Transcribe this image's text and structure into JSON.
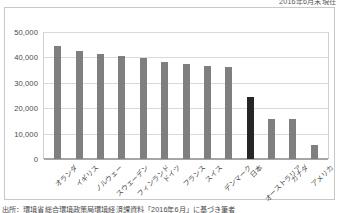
{
  "header": {
    "note": "2016年6月末現在"
  },
  "footer": {
    "source": "出所：環境省総合環境政策局環境経済課資料「2016年6月」に基づき筆者"
  },
  "chart_data": {
    "type": "bar",
    "title": "",
    "xlabel": "",
    "ylabel": "",
    "ylim": [
      0,
      50000
    ],
    "yticks": [
      "0",
      "10,000",
      "20,000",
      "30,000",
      "40,000",
      "50,000"
    ],
    "ytick_values": [
      0,
      10000,
      20000,
      30000,
      40000,
      50000
    ],
    "grid": true,
    "legend": "none",
    "categories": [
      "オランダ",
      "イギリス",
      "ノルウェー",
      "スウェーデン",
      "フィンランド",
      "ドイツ",
      "フランス",
      "スイス",
      "デンマーク",
      "日本",
      "オーストラリア",
      "カナダ",
      "アメリカ"
    ],
    "values": [
      44500,
      42500,
      41500,
      40700,
      39600,
      38100,
      37400,
      36600,
      36400,
      24400,
      15900,
      15900,
      5400
    ],
    "highlight_index": 9,
    "colors": {
      "bar": "#7f7f7f",
      "highlight": "#262626",
      "grid": "#d9d9d9",
      "axis": "#a6a6a6",
      "frame": "#c8c8c8"
    }
  }
}
